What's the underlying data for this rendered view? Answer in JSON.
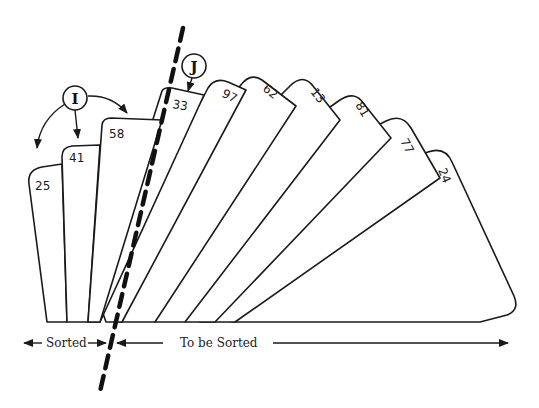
{
  "diagram": {
    "sorted_cards": [
      {
        "value": "25"
      },
      {
        "value": "41"
      },
      {
        "value": "58"
      }
    ],
    "unsorted_cards": [
      {
        "value": "33"
      },
      {
        "value": "97"
      },
      {
        "value": "62"
      },
      {
        "value": "13"
      },
      {
        "value": "81"
      },
      {
        "value": "77"
      },
      {
        "value": "24"
      }
    ],
    "markers": {
      "i": {
        "letter": "I"
      },
      "j": {
        "letter": "J"
      }
    },
    "labels": {
      "sorted": "Sorted",
      "to_be_sorted": "To be Sorted"
    },
    "colors": {
      "ink": "#1a1a1a",
      "background": "#ffffff"
    }
  }
}
